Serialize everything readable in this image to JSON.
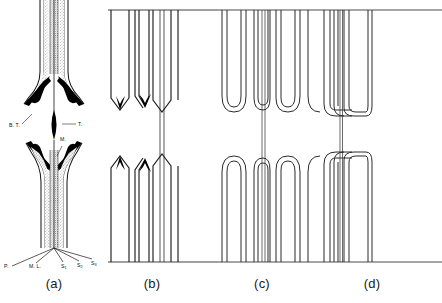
{
  "figure": {
    "panels": [
      {
        "id": "a",
        "caption": "(a)",
        "kind": "anatomical-section",
        "labels": [
          {
            "name": "branch-trace",
            "text": "B. T.",
            "x": 9,
            "y": 126
          },
          {
            "name": "trace",
            "text": "T.",
            "x": 78,
            "y": 125
          },
          {
            "name": "midrib",
            "text": "M.",
            "x": 60,
            "y": 140
          },
          {
            "name": "petiole",
            "text": "P.",
            "x": 4,
            "y": 266
          },
          {
            "name": "median-leaf",
            "text": "M. L.",
            "x": 30,
            "y": 266
          }
        ],
        "subscript_labels": [
          {
            "name": "strand-1",
            "base": "S",
            "sub": "1",
            "x": 62,
            "y": 266
          },
          {
            "name": "strand-2",
            "base": "S",
            "sub": "2",
            "x": 79,
            "y": 265
          },
          {
            "name": "strand-3",
            "base": "S",
            "sub": "3",
            "x": 93,
            "y": 263
          }
        ]
      },
      {
        "id": "b",
        "caption": "(b)",
        "kind": "chevron-terminations"
      },
      {
        "id": "c",
        "caption": "(c)",
        "kind": "rounded-loop-terminations"
      },
      {
        "id": "d",
        "caption": "(d)",
        "kind": "square-loop-terminations"
      }
    ],
    "colors": {
      "ink": "#111111",
      "line": "#3a3a3a",
      "stipple": "#6f6f6f",
      "background": "#ffffff"
    }
  }
}
